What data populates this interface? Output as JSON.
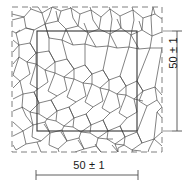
{
  "figure": {
    "background_color": "#ffffff",
    "grain_line_color": "#4d4d4d",
    "outer_boundary_color": "#808080",
    "inner_boundary_color": "#333333",
    "dimension_line_color": "#4d4d4d",
    "text_color": "#1a1a1a"
  },
  "specimen": {
    "outer_boundary": {
      "name": "dashed-outer-square",
      "style": "dashed",
      "x": 12,
      "y": 7,
      "width": 150,
      "height": 145
    },
    "inner_boundary": {
      "name": "solid-inner-square",
      "style": "solid",
      "x": 37,
      "y": 31,
      "width": 100,
      "height": 100
    },
    "texture": "voronoi-grain-structure"
  },
  "dimensions": {
    "width": {
      "label": "50 ± 1",
      "value": 50,
      "tolerance": 1,
      "orientation": "horizontal",
      "line": {
        "x1": 36,
        "x2": 138,
        "y": 175
      }
    },
    "height": {
      "label": "50 ± 1",
      "value": 50,
      "tolerance": 1,
      "orientation": "vertical",
      "line": {
        "y1": 31,
        "y2": 131,
        "x": 177
      }
    }
  }
}
